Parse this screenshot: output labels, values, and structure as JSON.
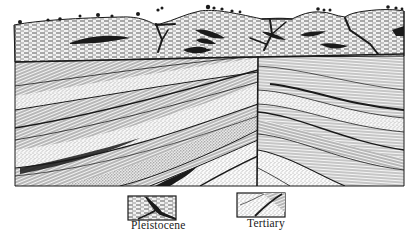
{
  "figure": {
    "type": "geological cross-section",
    "colors": {
      "ink": "#1a1a1a",
      "paper": "#ffffff",
      "pleistocene_fill": "#d9d9d9",
      "tertiary_fill_light": "#e6e6e6",
      "tertiary_fill_dark": "#bdbdbd"
    }
  },
  "units": [
    {
      "id": "pleistocene",
      "label": "Pleistocene",
      "pattern": "dashed-horizontal with dark lenses and channel fills"
    },
    {
      "id": "tertiary",
      "label": "Tertiary",
      "pattern": "inclined fine-lined and stippled bands"
    }
  ],
  "legend": {
    "items": [
      {
        "label": "Pleistocene",
        "swatch": "pleistocene"
      },
      {
        "label": "Tertiary",
        "swatch": "tertiary"
      }
    ]
  },
  "features": {
    "fault": "vertical fault at center",
    "unconformity": "near-horizontal erosion surface between Pleistocene and Tertiary",
    "folds": "strata dip away on left limb, curve down on right limb"
  }
}
